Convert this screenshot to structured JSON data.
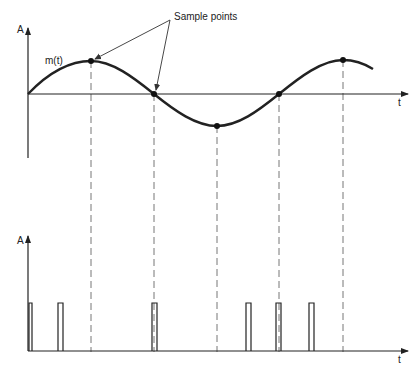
{
  "figure": {
    "type": "diagram",
    "colors": {
      "line": "#222222",
      "dashed": "#777777",
      "background": "#ffffff"
    }
  },
  "top_plot": {
    "y_axis_label": "A",
    "x_axis_label": "t",
    "signal_label": "m(t)",
    "annotation": "Sample points",
    "sample_points": [
      {
        "x": 91,
        "y": 61
      },
      {
        "x": 154,
        "y": 94
      },
      {
        "x": 217,
        "y": 126
      },
      {
        "x": 279,
        "y": 94
      },
      {
        "x": 343,
        "y": 60
      }
    ]
  },
  "bottom_plot": {
    "y_axis_label": "A",
    "x_axis_label": "t",
    "pulses_x": [
      28,
      58,
      152,
      246,
      276,
      309
    ]
  }
}
